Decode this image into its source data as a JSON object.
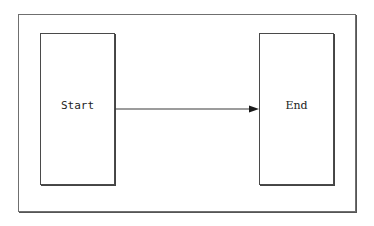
{
  "diagram": {
    "nodes": [
      {
        "id": "start",
        "label": "Start"
      },
      {
        "id": "end",
        "label": "End"
      }
    ],
    "edges": [
      {
        "from": "start",
        "to": "end",
        "type": "arrow"
      }
    ],
    "colors": {
      "stroke": "#4a4a4a",
      "frame": "#6f6f6f",
      "background": "#ffffff",
      "text": "#222222"
    }
  }
}
